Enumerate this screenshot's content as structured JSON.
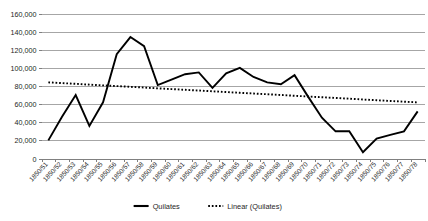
{
  "chart_data": {
    "type": "line",
    "title": "",
    "subtitle": "",
    "xlabel": "",
    "ylabel": "",
    "ylim": [
      0,
      160000
    ],
    "ytick_labels": [
      "160,000",
      "140,000",
      "120,000",
      "100,000",
      "80,000",
      "60,000",
      "40,000",
      "20,000",
      "0"
    ],
    "ytick_values": [
      160000,
      140000,
      120000,
      100000,
      80000,
      60000,
      40000,
      20000,
      0
    ],
    "grid": true,
    "legend_position": "bottom",
    "categories": [
      "1850/51",
      "1850/52",
      "1850/53",
      "1850/54",
      "1850/55",
      "1850/56",
      "1850/57",
      "1850/58",
      "1850/59",
      "1850/60",
      "1850/61",
      "1850/62",
      "1850/63",
      "1850/64",
      "1850/65",
      "1850/66",
      "1850/67",
      "1850/68",
      "1850/69",
      "1850/70",
      "1850/71",
      "1850/72",
      "1850/73",
      "1850/74",
      "1850/75",
      "1850/76",
      "1850/77",
      "1850/78"
    ],
    "series": [
      {
        "name": "Quilates",
        "style": "solid",
        "color": "#000000",
        "values": [
          20000,
          46000,
          70000,
          36000,
          62000,
          115000,
          134000,
          124000,
          81000,
          87000,
          93000,
          95000,
          78000,
          94000,
          100000,
          90000,
          84000,
          82000,
          92000,
          68000,
          45000,
          30000,
          30000,
          7000,
          22000,
          26000,
          30000,
          52000
        ]
      },
      {
        "name": "Linear (Quilates)",
        "style": "dotted",
        "color": "#000000",
        "trend": true,
        "values": [
          84000,
          83200,
          82400,
          81500,
          80700,
          79900,
          79100,
          78300,
          77400,
          76600,
          75800,
          75000,
          74200,
          73300,
          72500,
          71700,
          70900,
          70100,
          69200,
          68400,
          67600,
          66800,
          66000,
          65100,
          64300,
          63500,
          62700,
          61900
        ]
      }
    ],
    "legend": [
      {
        "label": "Quilates",
        "marker": "solid-line"
      },
      {
        "label": "Linear (Quilates)",
        "marker": "dotted-line"
      }
    ]
  }
}
